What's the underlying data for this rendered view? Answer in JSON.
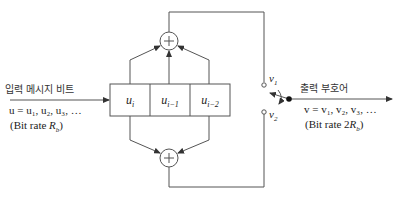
{
  "diagram": {
    "type": "convolutional-encoder",
    "input": {
      "title": "입력 메시지 비트",
      "sequence": "u = u₁, u₂, u₃, …",
      "rate": "(Bit rate R_b)",
      "rate_prefix": "(Bit rate ",
      "rate_symbol": "R",
      "rate_sub": "b",
      "rate_suffix": ")"
    },
    "register": {
      "cells": [
        "u_i",
        "u_{i−1}",
        "u_{i−2}"
      ],
      "cell_main": [
        "u",
        "u",
        "u"
      ],
      "cell_sub": [
        "i",
        "i−1",
        "i−2"
      ]
    },
    "adders": [
      {
        "name": "upper",
        "symbol": "+",
        "inputs": [
          "u_i",
          "u_{i−1}",
          "u_{i−2}"
        ],
        "output": "v1"
      },
      {
        "name": "lower",
        "symbol": "+",
        "inputs": [
          "u_i",
          "u_{i−2}"
        ],
        "output": "v2"
      }
    ],
    "switch": {
      "tap1_main": "v",
      "tap1_sub": "1",
      "tap2_main": "v",
      "tap2_sub": "2"
    },
    "output": {
      "title": "출력 부호어",
      "sequence": "v = v₁, v₂, v₃, …",
      "rate_prefix": "(Bit rate 2",
      "rate_symbol": "R",
      "rate_sub": "b",
      "rate_suffix": ")"
    },
    "colors": {
      "line": "#555555",
      "text": "#222222"
    }
  }
}
